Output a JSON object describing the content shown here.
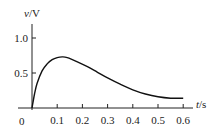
{
  "chart_data": {
    "type": "line",
    "title": "",
    "xlabel_var": "t",
    "xlabel_unit": "/s",
    "ylabel_var": "v",
    "ylabel_unit": "/V",
    "origin_label": "0",
    "xticks": [
      "0.1",
      "0.2",
      "0.3",
      "0.4",
      "0.5",
      "0.6"
    ],
    "yticks": [
      "0.5",
      "1.0"
    ],
    "xlim": [
      0,
      0.62
    ],
    "ylim": [
      0,
      1.2
    ],
    "grid": false,
    "series": [
      {
        "name": "v(t)",
        "x": [
          0.0,
          0.01,
          0.02,
          0.04,
          0.06,
          0.08,
          0.1,
          0.12,
          0.14,
          0.18,
          0.22,
          0.26,
          0.3,
          0.35,
          0.4,
          0.45,
          0.5,
          0.55,
          0.6
        ],
        "values": [
          0.0,
          0.2,
          0.35,
          0.53,
          0.63,
          0.69,
          0.72,
          0.73,
          0.72,
          0.66,
          0.59,
          0.51,
          0.43,
          0.34,
          0.26,
          0.2,
          0.16,
          0.14,
          0.14
        ]
      }
    ]
  }
}
